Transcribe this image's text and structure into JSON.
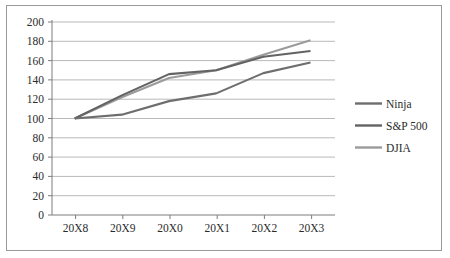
{
  "chart_data": {
    "type": "line",
    "title": "",
    "subtitle": "",
    "xlabel": "",
    "ylabel": "",
    "categories": [
      "20X8",
      "20X9",
      "20X0",
      "20X1",
      "20X2",
      "20X3"
    ],
    "ylim": [
      0,
      200
    ],
    "ytick_step": 20,
    "yticks": [
      200,
      180,
      160,
      140,
      120,
      100,
      80,
      60,
      40,
      20,
      0
    ],
    "grid": true,
    "legend_position": "right",
    "series": [
      {
        "name": "Ninja",
        "color": "#6e6e6e",
        "values": [
          100,
          104,
          118,
          126,
          147,
          158
        ]
      },
      {
        "name": "S&P 500",
        "color": "#636363",
        "values": [
          100,
          124,
          146,
          150,
          164,
          170
        ]
      },
      {
        "name": "DJIA",
        "color": "#9b9b9b",
        "values": [
          100,
          122,
          142,
          150,
          166,
          181
        ]
      }
    ]
  },
  "axis": {
    "ytick_labels": [
      "200",
      "180",
      "160",
      "140",
      "120",
      "100",
      "80",
      "60",
      "40",
      "20",
      "0"
    ],
    "xtick_labels": [
      "20X8",
      "20X9",
      "20X0",
      "20X1",
      "20X2",
      "20X3"
    ]
  },
  "legend": {
    "items": [
      {
        "label": "Ninja",
        "color": "#6e6e6e"
      },
      {
        "label": "S&P 500",
        "color": "#636363"
      },
      {
        "label": "DJIA",
        "color": "#9b9b9b"
      }
    ]
  },
  "colors": {
    "frame": "#9a9a9a",
    "gridline": "#b9b9b9",
    "axis": "#7d7d7d",
    "text": "#2b2b2b",
    "background": "#ffffff"
  }
}
